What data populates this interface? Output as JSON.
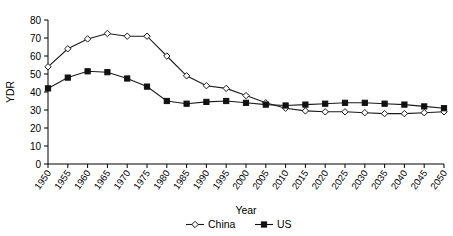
{
  "chart_data": {
    "type": "line",
    "title": "",
    "xlabel": "Year",
    "ylabel": "YDR",
    "xlim": [
      1950,
      2050
    ],
    "ylim": [
      0,
      80
    ],
    "ytick_step": 10,
    "grid": false,
    "legend_position": "bottom",
    "x": [
      1950,
      1955,
      1960,
      1965,
      1970,
      1975,
      1980,
      1985,
      1990,
      1995,
      2000,
      2005,
      2010,
      2015,
      2020,
      2025,
      2030,
      2035,
      2040,
      2045,
      2050
    ],
    "categories": [
      "1950",
      "1955",
      "1960",
      "1965",
      "1970",
      "1975",
      "1980",
      "1985",
      "1990",
      "1995",
      "2000",
      "2005",
      "2010",
      "2015",
      "2020",
      "2025",
      "2030",
      "2035",
      "2040",
      "2045",
      "2050"
    ],
    "ytick_labels": [
      "0",
      "10",
      "20",
      "30",
      "40",
      "50",
      "60",
      "70",
      "80"
    ],
    "series": [
      {
        "name": "China",
        "marker": "open-diamond",
        "color": "#1a1a1a",
        "values": [
          54,
          64,
          69.5,
          72.5,
          71,
          71,
          60,
          49,
          43.5,
          42,
          38,
          34,
          31,
          29.5,
          29,
          29,
          28.5,
          28,
          28,
          28.5,
          29
        ]
      },
      {
        "name": "US",
        "marker": "filled-square",
        "color": "#111111",
        "values": [
          42,
          48,
          51.5,
          51,
          47.5,
          43,
          35,
          33.5,
          34.5,
          35,
          34,
          33,
          32.5,
          33,
          33.5,
          34,
          34,
          33.5,
          33,
          32,
          31
        ]
      }
    ]
  },
  "legend": {
    "items": [
      {
        "label": "China"
      },
      {
        "label": "US"
      }
    ]
  }
}
